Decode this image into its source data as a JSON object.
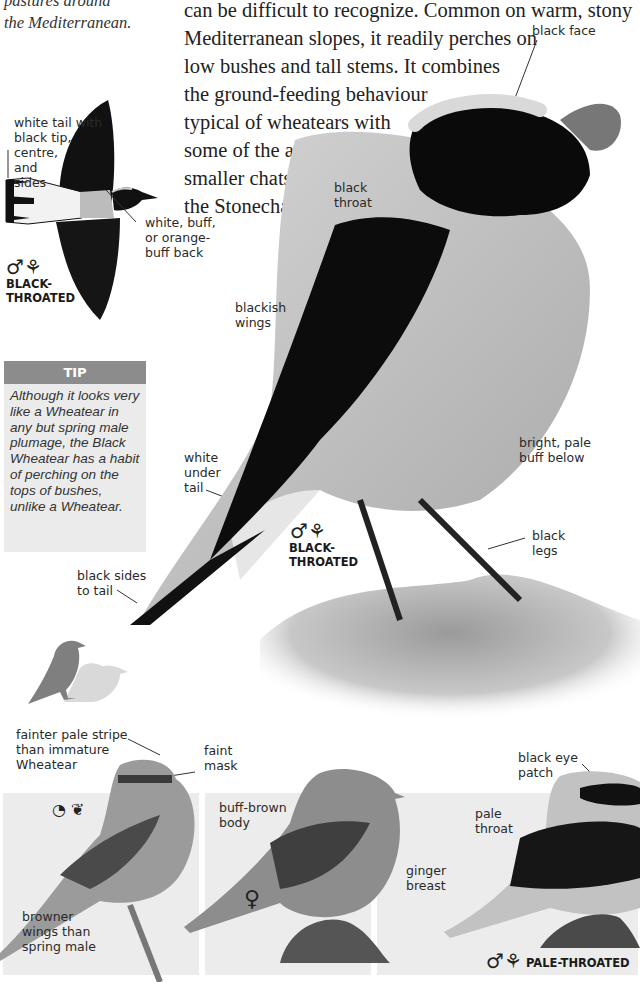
{
  "intro": {
    "italic_lines": [
      "pastures around",
      "the Mediterranean."
    ],
    "body_lines": [
      "can be difficult to recognize. Common on warm, stony",
      "Mediterranean slopes, it readily perches on",
      "low bushes and tall stems. It combines",
      "the ground-feeding behaviour",
      "typical of wheatears with",
      "some of the actions of",
      "smaller chats such as",
      "the Stonechat."
    ]
  },
  "flight_illustration": {
    "labels": {
      "tail": "white tail with\nblack tip,\ncentre,\nand\nsides",
      "back": "white, buff,\nor orange-\nbuff back"
    },
    "symbols": "♂⚘",
    "sex_label": "BLACK-\nTHROATED"
  },
  "tip": {
    "heading": "TIP",
    "text": "Although it looks very like a Wheatear in any but spring male plumage, the Black Wheatear has a habit of perching on the tops of bushes, unlike a Wheatear."
  },
  "main_photo": {
    "labels": {
      "black_face": "black face",
      "black_throat": "black\nthroat",
      "blackish_wings": "blackish\nwings",
      "buff_below": "bright, pale\nbuff below",
      "white_under_tail": "white\nunder\ntail",
      "black_legs": "black\nlegs",
      "black_sides_tail": "black sides\nto tail"
    },
    "symbols": "♂⚘",
    "sex_label": "BLACK-\nTHROATED"
  },
  "size_comparison": {
    "icon": "bird-silhouette-size-comparison"
  },
  "bottom_panels": [
    {
      "labels": {
        "stripe": "fainter pale stripe\nthan immature\nWheatear",
        "mask": "faint\nmask",
        "wings": "browner\nwings than\nspring male"
      },
      "symbols": "◔ ❦",
      "symbol_meaning": [
        "immature-icon",
        "autumn-icon"
      ]
    },
    {
      "labels": {
        "body": "buff-brown\nbody",
        "breast": "ginger\nbreast"
      },
      "symbols": "♀"
    },
    {
      "labels": {
        "eye_patch": "black eye\npatch",
        "throat": "pale\nthroat"
      },
      "symbols": "♂⚘",
      "sex_label": "PALE-THROATED"
    }
  ],
  "colors": {
    "tip_header": "#8c8c8c",
    "tip_bg": "#ebebeb",
    "panel_bg": "#ececec",
    "plumage_black": "#111111",
    "plumage_buff": "#bdbdbd"
  }
}
